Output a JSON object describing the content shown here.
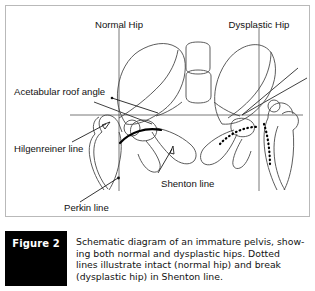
{
  "figure": {
    "tag_label": "Figure 2",
    "caption_lines": [
      "Schematic diagram of an immature pelvis, show-",
      "ing both normal and dysplastic hips. Dotted",
      "lines illustrate intact (normal hip) and break",
      "(dysplastic hip) in Shenton line."
    ]
  },
  "diagram": {
    "title_labels": {
      "normal_hip": "Normal Hip",
      "dysplastic_hip": "Dysplastic Hip"
    },
    "annotations": {
      "acetabular_roof_angle": "Acetabular roof angle",
      "hilgenreiner_line": "Hilgenreiner line",
      "shenton_line": "Shenton line",
      "perkin_line": "Perkin line"
    },
    "colors": {
      "bone_outline": "#4a4a4a",
      "reference_line": "#555555",
      "shenton_line": "#000000",
      "label_text": "#111111",
      "tag_background": "#000000",
      "tag_text": "#ffffff",
      "panel_border": "#b9b9b9",
      "background": "#ffffff"
    }
  }
}
